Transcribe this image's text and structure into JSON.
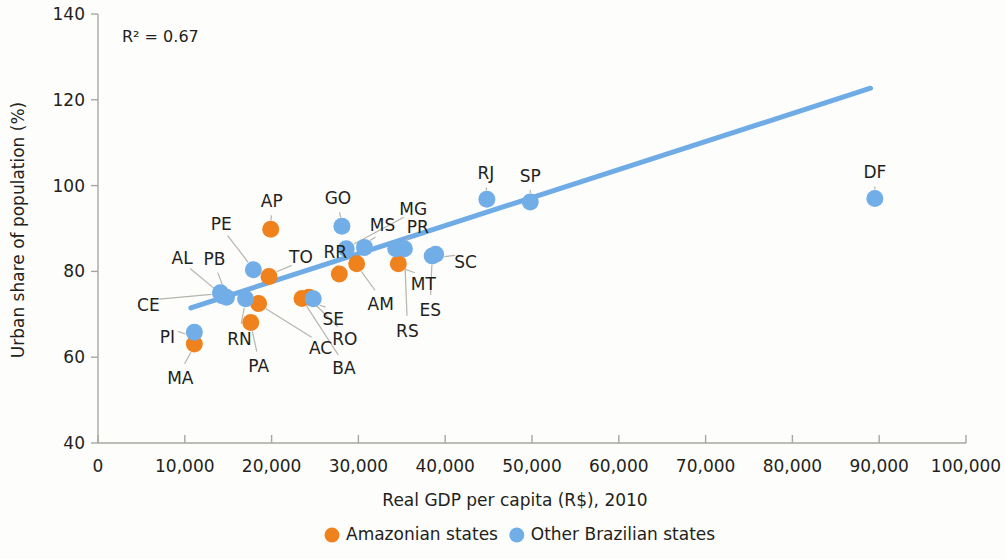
{
  "chart_data": {
    "type": "scatter",
    "title": "",
    "xlabel": "Real GDP per capita (R$), 2010",
    "ylabel": "Urban share of population (%)",
    "xlim": [
      0,
      100000
    ],
    "ylim": [
      40,
      140
    ],
    "xticks": [
      0,
      10000,
      20000,
      30000,
      40000,
      50000,
      60000,
      70000,
      80000,
      90000,
      100000
    ],
    "xticklabels": [
      "0",
      "10,000",
      "20,000",
      "30,000",
      "40,000",
      "50,000",
      "60,000",
      "70,000",
      "80,000",
      "90,000",
      "100,000"
    ],
    "yticks": [
      40,
      60,
      80,
      100,
      120,
      140
    ],
    "yticklabels": [
      "40",
      "60",
      "80",
      "100",
      "120",
      "140"
    ],
    "grid": false,
    "annotation": "R² = 0.67",
    "r_squared": 0.67,
    "trendline": {
      "x0": 10700,
      "y0": 71.5,
      "x1": 89000,
      "y1": 122.7
    },
    "legend_position": "bottom",
    "series": [
      {
        "name": "Amazonian states",
        "color": "#F0821E",
        "points": [
          {
            "label": "MA",
            "x": 11100,
            "y": 63.1,
            "label_dx": -14,
            "label_dy": 34
          },
          {
            "label": "PA",
            "x": 17600,
            "y": 68.1,
            "label_dx": 8,
            "label_dy": 44
          },
          {
            "label": "AC",
            "x": 18500,
            "y": 72.5,
            "label_dx": 62,
            "label_dy": 44
          },
          {
            "label": "TO",
            "x": 19700,
            "y": 78.8,
            "label_dx": 32,
            "label_dy": -20
          },
          {
            "label": "AP",
            "x": 19900,
            "y": 89.8,
            "label_dx": 1,
            "label_dy": -28
          },
          {
            "label": "BA",
            "x": 23500,
            "y": 73.7,
            "label_dx": 42,
            "label_dy": 70
          },
          {
            "label": "RO",
            "x": 24300,
            "y": 74.0,
            "label_dx": 36,
            "label_dy": 42
          },
          {
            "label": "RR",
            "x": 27800,
            "y": 79.4,
            "label_dx": -4,
            "label_dy": -22
          },
          {
            "label": "AM",
            "x": 29800,
            "y": 81.8,
            "label_dx": 24,
            "label_dy": 40
          },
          {
            "label": "MT",
            "x": 34600,
            "y": 81.8,
            "label_dx": 25,
            "label_dy": 20
          }
        ]
      },
      {
        "name": "Other Brazilian states",
        "color": "#71AEE8",
        "points": [
          {
            "label": "PI",
            "x": 11100,
            "y": 65.8,
            "label_dx": -27,
            "label_dy": 5
          },
          {
            "label": "CE",
            "x": 14100,
            "y": 75.0,
            "label_dx": -72,
            "label_dy": 12
          },
          {
            "label": "AL",
            "x": 14300,
            "y": 74.3,
            "label_dx": -40,
            "label_dy": -38
          },
          {
            "label": "PB",
            "x": 14800,
            "y": 74.0,
            "label_dx": -12,
            "label_dy": -38
          },
          {
            "label": "RN",
            "x": 17000,
            "y": 73.6,
            "label_dx": -6,
            "label_dy": 40
          },
          {
            "label": "PE",
            "x": 17900,
            "y": 80.4,
            "label_dx": -32,
            "label_dy": -46
          },
          {
            "label": "SE",
            "x": 24800,
            "y": 73.6,
            "label_dx": 20,
            "label_dy": 20
          },
          {
            "label": "GO",
            "x": 28100,
            "y": 90.5,
            "label_dx": -4,
            "label_dy": -28
          },
          {
            "label": "MG",
            "x": 28600,
            "y": 85.3,
            "label_dx": 67,
            "label_dy": -40
          },
          {
            "label": "MS",
            "x": 30700,
            "y": 85.6,
            "label_dx": 18,
            "label_dy": -22
          },
          {
            "label": "PR",
            "x": 34300,
            "y": 85.3,
            "label_dx": 22,
            "label_dy": -22
          },
          {
            "label": "RS",
            "x": 35300,
            "y": 85.3,
            "label_dx": 3,
            "label_dy": 82
          },
          {
            "label": "ES",
            "x": 38500,
            "y": 83.6,
            "label_dx": -2,
            "label_dy": 54
          },
          {
            "label": "SC",
            "x": 38900,
            "y": 84.0,
            "label_dx": 30,
            "label_dy": 8
          },
          {
            "label": "RJ",
            "x": 44800,
            "y": 96.8,
            "label_dx": -1,
            "label_dy": -26
          },
          {
            "label": "SP",
            "x": 49800,
            "y": 96.2,
            "label_dx": 0,
            "label_dy": -26
          },
          {
            "label": "DF",
            "x": 89500,
            "y": 97.0,
            "label_dx": 0,
            "label_dy": -26
          }
        ]
      }
    ]
  },
  "legend": {
    "items": [
      {
        "label": "Amazonian states",
        "color": "#F0821E"
      },
      {
        "label": "Other Brazilian states",
        "color": "#71AEE8"
      }
    ]
  }
}
